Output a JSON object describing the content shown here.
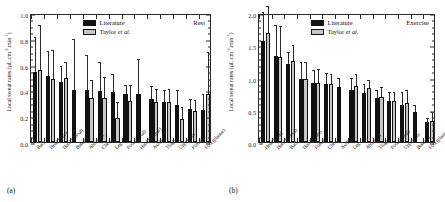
{
  "figure": {
    "panel_a_tag": "(a)",
    "panel_b_tag": "(b)"
  },
  "legend": {
    "literature": "Literature",
    "taylor_prefix": "Taylor ",
    "taylor_italic": "et al."
  },
  "chart_data": [
    {
      "type": "bar",
      "panel": "(a)",
      "title": "Rest",
      "xlabel": "",
      "ylabel": "Local sweat rates (µL.cm⁻².min⁻¹)",
      "ylabel_plain": "Local sweat rates (uL.cm-2.min-1)",
      "ylim": [
        0.0,
        1.0
      ],
      "yticks": [
        0.0,
        0.2,
        0.4,
        0.6,
        0.8,
        1.0
      ],
      "ytick_labels": [
        "0.0",
        "0.2",
        "0.4",
        "0.6",
        "0.8",
        "1.0"
      ],
      "yminor_step": 0.05,
      "grid": false,
      "legend_position": "top-center",
      "categories": [
        "Back",
        "Head (face)",
        "Hand (dorsal)",
        "Buttocks",
        "Abdomen",
        "Chest",
        "Leg",
        "Foot (dorsal)",
        "Hand (palmar)",
        "Axilla",
        "Thigh",
        "Upper arm",
        "Forearm",
        "Foot (plantar)"
      ],
      "series": [
        {
          "name": "Literature",
          "color": "#111111",
          "values": [
            0.545,
            0.51,
            0.465,
            0.405,
            0.4,
            0.395,
            0.385,
            0.372,
            0.37,
            0.33,
            0.312,
            0.287,
            0.258,
            0.245
          ],
          "errors": [
            0.265,
            0.19,
            0.12,
            0.39,
            0.265,
            0.215,
            0.135,
            0.062,
            0.265,
            0.095,
            0.083,
            0.112,
            0.068,
            0.118
          ]
        },
        {
          "name": "Taylor et al.",
          "color": "#c6c6c6",
          "values": [
            0.56,
            0.49,
            0.5,
            null,
            0.345,
            0.345,
            0.188,
            0.318,
            null,
            0.312,
            0.312,
            0.175,
            0.24,
            0.37
          ]
        }
      ],
      "series_b_errors": [
        0.34,
        0.215,
        0.115,
        null,
        0.128,
        0.15,
        0.118,
        0.118,
        null,
        0.093,
        0.093,
        0.09,
        0.082,
        0.318
      ],
      "pairs": [
        {
          "category": "Back",
          "literature": 0.545,
          "literature_err": 0.265,
          "taylor": 0.56,
          "taylor_err": 0.34
        },
        {
          "category": "Head (face)",
          "literature": 0.51,
          "literature_err": 0.19,
          "taylor": 0.49,
          "taylor_err": 0.215
        },
        {
          "category": "Hand (dorsal)",
          "literature": 0.465,
          "literature_err": 0.12,
          "taylor": 0.5,
          "taylor_err": 0.115
        },
        {
          "category": "Buttocks",
          "literature": 0.405,
          "literature_err": 0.39,
          "taylor": null,
          "taylor_err": null
        },
        {
          "category": "Abdomen",
          "literature": 0.4,
          "literature_err": 0.265,
          "taylor": 0.345,
          "taylor_err": 0.128
        },
        {
          "category": "Chest",
          "literature": 0.395,
          "literature_err": 0.215,
          "taylor": 0.345,
          "taylor_err": 0.15
        },
        {
          "category": "Leg",
          "literature": 0.385,
          "literature_err": 0.135,
          "taylor": 0.188,
          "taylor_err": 0.118
        },
        {
          "category": "Foot (dorsal)",
          "literature": 0.372,
          "literature_err": 0.062,
          "taylor": 0.318,
          "taylor_err": 0.118
        },
        {
          "category": "Hand (palmar)",
          "literature": 0.37,
          "literature_err": 0.265,
          "taylor": null,
          "taylor_err": null
        },
        {
          "category": "Axilla",
          "literature": 0.33,
          "literature_err": 0.095,
          "taylor": 0.312,
          "taylor_err": 0.093
        },
        {
          "category": "Thigh",
          "literature": 0.312,
          "literature_err": 0.083,
          "taylor": 0.312,
          "taylor_err": 0.093
        },
        {
          "category": "Upper arm",
          "literature": 0.287,
          "literature_err": 0.112,
          "taylor": 0.175,
          "taylor_err": 0.09
        },
        {
          "category": "Forearm",
          "literature": 0.258,
          "literature_err": 0.068,
          "taylor": 0.24,
          "taylor_err": 0.082
        },
        {
          "category": "Foot (plantar)",
          "literature": 0.245,
          "literature_err": 0.118,
          "taylor": 0.37,
          "taylor_err": 0.318
        }
      ]
    },
    {
      "type": "bar",
      "panel": "(b)",
      "title": "Exercise",
      "xlabel": "",
      "ylabel": "Local sweat rates (µL.cm⁻².min⁻¹)",
      "ylabel_plain": "Local sweat rates (uL.cm-2.min-1)",
      "ylim": [
        0.0,
        2.0
      ],
      "yticks": [
        0.0,
        0.5,
        1.0,
        1.5,
        2.0
      ],
      "ytick_labels": [
        "0.0",
        "0.5",
        "1.0",
        "1.5",
        "2.0"
      ],
      "yminor_step": 0.1,
      "grid": false,
      "legend_position": "top-center",
      "categories": [
        "Head (face)",
        "Hand (dorsal)",
        "Back",
        "Hand (palm)",
        "Forearm",
        "Chest",
        "Axilla",
        "Leg",
        "Abdomen",
        "Thigh",
        "Foot (dorsal)",
        "Upper arm",
        "Buttocks",
        "Foot (plantar)"
      ],
      "pairs": [
        {
          "category": "Head (face)",
          "literature": 1.565,
          "literature_err": 0.43,
          "taylor": 1.685,
          "taylor_err": 0.415
        },
        {
          "category": "Hand (dorsal)",
          "literature": 1.33,
          "literature_err": 0.465,
          "taylor": 1.325,
          "taylor_err": 0.46
        },
        {
          "category": "Back",
          "literature": 1.215,
          "literature_err": 0.165,
          "taylor": 1.25,
          "taylor_err": 0.245
        },
        {
          "category": "Hand (palm)",
          "literature": 0.97,
          "literature_err": 0.26,
          "taylor": 0.975,
          "taylor_err": 0.255
        },
        {
          "category": "Forearm",
          "literature": 0.915,
          "literature_err": 0.185,
          "taylor": 0.92,
          "taylor_err": 0.205
        },
        {
          "category": "Chest",
          "literature": 0.895,
          "literature_err": 0.155,
          "taylor": 0.895,
          "taylor_err": 0.145
        },
        {
          "category": "Axilla",
          "literature": 0.85,
          "literature_err": 0.13,
          "taylor": null,
          "taylor_err": null
        },
        {
          "category": "Leg",
          "literature": 0.81,
          "literature_err": 0.175,
          "taylor": 0.865,
          "taylor_err": 0.175
        },
        {
          "category": "Abdomen",
          "literature": 0.765,
          "literature_err": 0.115,
          "taylor": 0.835,
          "taylor_err": 0.11
        },
        {
          "category": "Thigh",
          "literature": 0.675,
          "literature_err": 0.125,
          "taylor": 0.7,
          "taylor_err": 0.14
        },
        {
          "category": "Foot (dorsal)",
          "literature": 0.64,
          "literature_err": 0.115,
          "taylor": 0.64,
          "taylor_err": 0.115
        },
        {
          "category": "Upper arm",
          "literature": 0.58,
          "literature_err": 0.175,
          "taylor": 0.605,
          "taylor_err": 0.18
        },
        {
          "category": "Buttocks",
          "literature": 0.47,
          "literature_err": 0.085,
          "taylor": null,
          "taylor_err": null
        },
        {
          "category": "Foot (plantar)",
          "literature": 0.305,
          "literature_err": 0.06,
          "taylor": 0.32,
          "taylor_err": 0.125
        }
      ]
    }
  ]
}
